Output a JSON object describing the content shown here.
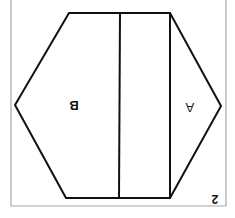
{
  "figure": {
    "number": "2",
    "rotation_deg": 180,
    "labels": [
      {
        "id": "A",
        "text": "A"
      },
      {
        "id": "B",
        "text": "B"
      }
    ],
    "colors": {
      "stroke": "#111111",
      "frame": "#9a9a9a",
      "background": "#ffffff"
    }
  }
}
